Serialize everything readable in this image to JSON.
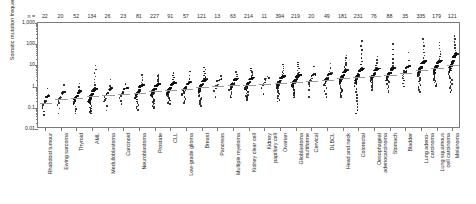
{
  "axes": {
    "ylabel": "Somatic mutation frequency (/Mb)",
    "yticks": [
      "1,000",
      "100",
      "10",
      "1",
      "0.1",
      "0.01"
    ],
    "n_prefix": "n ="
  },
  "chart_data": {
    "type": "scatter",
    "title": "",
    "xlabel": "",
    "ylabel": "Somatic mutation frequency (/Mb)",
    "ylim": [
      0.01,
      1000
    ],
    "yscale": "log",
    "grid": false,
    "legend": null,
    "note": "Beeswarm / strip plot: each point is one tumour sample; cohorts ordered by increasing median somatic mutation frequency. Top row gives sample count n per cohort.",
    "categories": [
      "Rhabdoid tumour",
      "Ewing sarcoma",
      "Thyroid",
      "AML",
      "Medulloblastoma",
      "Carcinoid",
      "Neuroblastoma",
      "Prostate",
      "CLL",
      "Low-grade glioma",
      "Breast",
      "Pancreas",
      "Multiple myeloma",
      "Kidney clear cell",
      "Kidney papillary cell",
      "Ovarian",
      "Glioblastoma multiforme",
      "Cervical",
      "DLBCL",
      "Head and neck",
      "Colorectal",
      "Oesophageal adenocarcinoma",
      "Stomach",
      "Bladder",
      "Lung adenocarcinoma",
      "Lung squamous cell carcinoma",
      "Melanoma"
    ],
    "category_lines": [
      [
        "Rhabdoid tumour"
      ],
      [
        "Ewing sarcoma"
      ],
      [
        "Thyroid"
      ],
      [
        "AML"
      ],
      [
        "Medulloblastoma"
      ],
      [
        "Carcinoid"
      ],
      [
        "Neuroblastoma"
      ],
      [
        "Prostate"
      ],
      [
        "CLL"
      ],
      [
        "Low-grade glioma"
      ],
      [
        "Breast"
      ],
      [
        "Pancreas"
      ],
      [
        "Multiple myeloma"
      ],
      [
        "Kidney clear cell"
      ],
      [
        "Kidney",
        "papillary cell"
      ],
      [
        "Ovarian"
      ],
      [
        "Glioblastoma",
        "multiforme"
      ],
      [
        "Cervical"
      ],
      [
        "DLBCL"
      ],
      [
        "Head and neck"
      ],
      [
        "Colorectal"
      ],
      [
        "Oesophageal",
        "adenocarcinoma"
      ],
      [
        "Stomach"
      ],
      [
        "Bladder"
      ],
      [
        "Lung adeno-",
        "carcinoma"
      ],
      [
        "Lung squamous",
        "cell carcinoma"
      ],
      [
        "Melanoma"
      ]
    ],
    "n": [
      22,
      20,
      52,
      134,
      26,
      23,
      81,
      227,
      91,
      57,
      121,
      13,
      63,
      214,
      11,
      394,
      219,
      20,
      49,
      181,
      231,
      76,
      88,
      35,
      335,
      179,
      121
    ],
    "medians": [
      0.17,
      0.25,
      0.28,
      0.35,
      0.4,
      0.45,
      0.5,
      0.62,
      0.7,
      0.78,
      0.95,
      1.05,
      1.15,
      1.25,
      1.3,
      1.45,
      1.7,
      1.8,
      2.0,
      2.6,
      2.7,
      3.2,
      3.4,
      4.4,
      6.4,
      7.2,
      10.5
    ],
    "iqr_low": [
      0.09,
      0.12,
      0.15,
      0.18,
      0.2,
      0.26,
      0.26,
      0.34,
      0.4,
      0.44,
      0.52,
      0.6,
      0.68,
      0.72,
      0.8,
      0.8,
      1.0,
      1.0,
      1.1,
      1.4,
      1.3,
      1.8,
      1.9,
      2.4,
      3.3,
      4.0,
      4.5
    ],
    "iqr_high": [
      0.3,
      0.45,
      0.5,
      0.62,
      0.7,
      0.72,
      0.95,
      1.05,
      1.2,
      1.3,
      1.7,
      1.8,
      1.9,
      2.1,
      2.1,
      2.5,
      2.8,
      3.1,
      3.4,
      4.6,
      5.2,
      5.6,
      6.0,
      7.5,
      12.0,
      13.0,
      24.0
    ],
    "min": [
      0.045,
      0.055,
      0.055,
      0.055,
      0.075,
      0.15,
      0.08,
      0.095,
      0.15,
      0.17,
      0.12,
      0.33,
      0.3,
      0.22,
      0.44,
      0.2,
      0.3,
      0.33,
      0.33,
      0.33,
      0.055,
      0.7,
      0.56,
      1.0,
      0.56,
      1.0,
      0.56
    ],
    "max": [
      0.8,
      1.2,
      1.4,
      10.0,
      2.2,
      1.3,
      3.6,
      3.8,
      4.4,
      5.2,
      8.0,
      3.2,
      5.0,
      7.0,
      3.0,
      11.0,
      14.0,
      9.0,
      12.0,
      30.0,
      140.0,
      26.0,
      100.0,
      40.0,
      180.0,
      120.0,
      250.0
    ]
  }
}
